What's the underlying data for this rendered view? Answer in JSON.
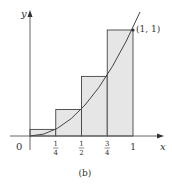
{
  "figure": {
    "caption": "(b)",
    "function": "y = x^2",
    "method": "right-endpoint Riemann sum, n = 4",
    "axes": {
      "x_label": "x",
      "y_label": "y",
      "origin_label": "0"
    },
    "x_ticks": [
      {
        "value": 0.25,
        "num": "1",
        "den": "4"
      },
      {
        "value": 0.5,
        "num": "1",
        "den": "2"
      },
      {
        "value": 0.75,
        "num": "3",
        "den": "4"
      },
      {
        "value": 1,
        "label": "1"
      }
    ],
    "rectangles": [
      {
        "x0": 0,
        "x1": 0.25,
        "height": 0.0625
      },
      {
        "x0": 0.25,
        "x1": 0.5,
        "height": 0.25
      },
      {
        "x0": 0.5,
        "x1": 0.75,
        "height": 0.5625
      },
      {
        "x0": 0.75,
        "x1": 1,
        "height": 1
      }
    ],
    "point": {
      "label": "(1, 1)",
      "x": 1,
      "y": 1
    },
    "colors": {
      "rect_fill": "#e6e6e6",
      "rect_stroke": "#444444",
      "curve": "#444444",
      "axis": "#555555"
    }
  }
}
